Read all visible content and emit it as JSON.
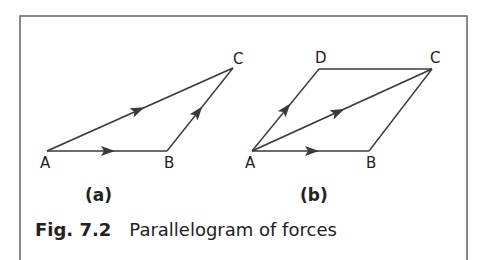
{
  "figure": {
    "number": "Fig. 7.2",
    "caption": "Parallelogram of forces"
  },
  "panel_a": {
    "label": "(a)",
    "points": {
      "A": "A",
      "B": "B",
      "C": "C"
    }
  },
  "panel_b": {
    "label": "(b)",
    "points": {
      "A": "A",
      "B": "B",
      "C": "C",
      "D": "D"
    }
  },
  "colors": {
    "line": "#3a3a3a",
    "frame": "#555555",
    "text": "#222222"
  }
}
